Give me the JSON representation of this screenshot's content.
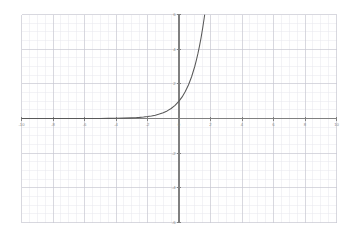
{
  "chart_data": {
    "type": "line",
    "title": "",
    "subtitle": "",
    "xlabel": "",
    "ylabel": "",
    "function": "y = 3^x",
    "xlim": [
      -10,
      10
    ],
    "ylim": [
      -6,
      6
    ],
    "grid": true,
    "major_grid_step": 2,
    "minor_grid_step": 0.5,
    "legend": "none",
    "x_tick_labels": [
      "-10",
      "-8",
      "-6",
      "-4",
      "-2",
      "0",
      "2",
      "4",
      "6",
      "8",
      "10"
    ],
    "x_tick_values": [
      -10,
      -8,
      -6,
      -4,
      -2,
      0,
      2,
      4,
      6,
      8,
      10
    ],
    "y_tick_labels": [
      "-6",
      "-4",
      "-2",
      "2",
      "4",
      "6"
    ],
    "y_tick_values": [
      -6,
      -4,
      -2,
      2,
      4,
      6
    ],
    "series": [
      {
        "name": "y = 3^x",
        "color": "#595959",
        "x": [
          -10,
          -9.5,
          -9,
          -8.5,
          -8,
          -7.5,
          -7,
          -6.5,
          -6,
          -5.5,
          -5,
          -4.5,
          -4,
          -3.5,
          -3,
          -2.75,
          -2.5,
          -2.25,
          -2,
          -1.75,
          -1.5,
          -1.25,
          -1,
          -0.75,
          -0.5,
          -0.25,
          0,
          0.2,
          0.4,
          0.6,
          0.8,
          1,
          1.1,
          1.2,
          1.3,
          1.4,
          1.5,
          1.6,
          1.63
        ],
        "y": [
          1.7e-05,
          3e-05,
          5.1e-05,
          8.9e-05,
          0.000152,
          0.000264,
          0.000457,
          0.000792,
          0.00137,
          0.002375,
          0.004115,
          0.007127,
          0.012346,
          0.021383,
          0.037037,
          0.048752,
          0.06415,
          0.084428,
          0.111111,
          0.146225,
          0.19245,
          0.253284,
          0.333333,
          0.438691,
          0.57735,
          0.759836,
          1,
          1.245731,
          1.551846,
          1.933182,
          2.40822,
          3,
          3.348,
          3.737,
          4.171,
          4.656,
          5.196,
          5.799,
          5.99
        ]
      }
    ],
    "curve_exit_top_x": 1.63,
    "y_intercept": 1,
    "asymptote": 0
  },
  "axes": {
    "x_axis_name": "x-axis",
    "y_axis_name": "y-axis",
    "axis_color": "#808080",
    "major_grid_color": "#c8c8d2",
    "minor_grid_color": "#e8e8ee",
    "curve_color": "#595959",
    "label_color": "#8a8a8a"
  }
}
